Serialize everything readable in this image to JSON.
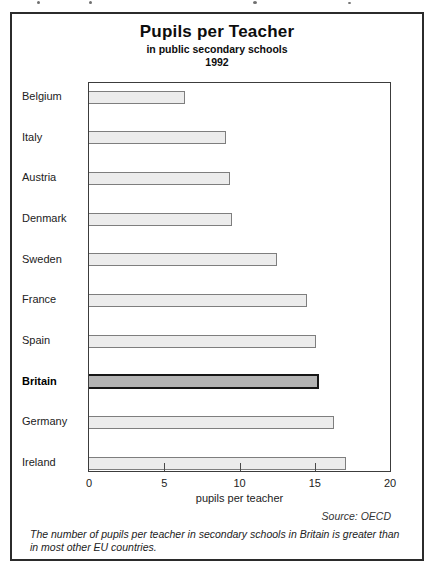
{
  "chart": {
    "title": "Pupils per Teacher",
    "subtitle": "in public secondary schools",
    "year": "1992",
    "xlabel": "pupils per teacher",
    "source": "Source: OECD",
    "caption": "The number of pupils per teacher in secondary schools in Britain is greater than in most other EU countries."
  },
  "chart_data": {
    "type": "bar",
    "orientation": "horizontal",
    "title": "Pupils per Teacher",
    "subtitle": "in public secondary schools",
    "year": "1992",
    "categories": [
      "Belgium",
      "Italy",
      "Austria",
      "Denmark",
      "Sweden",
      "France",
      "Spain",
      "Britain",
      "Germany",
      "Ireland"
    ],
    "values": [
      6.4,
      9.1,
      9.4,
      9.5,
      12.5,
      14.5,
      15.1,
      15.3,
      16.3,
      17.1
    ],
    "highlight_category": "Britain",
    "xlabel": "pupils per teacher",
    "xlim": [
      0,
      20
    ],
    "xticks": [
      0,
      5,
      10,
      15,
      20
    ],
    "grid": false,
    "legend": false,
    "source": "Source: OECD",
    "colors": {
      "bar_fill": "#ececec",
      "bar_border": "#7e7e7e",
      "highlight_fill": "#b4b4b4",
      "highlight_border": "#171717"
    }
  }
}
